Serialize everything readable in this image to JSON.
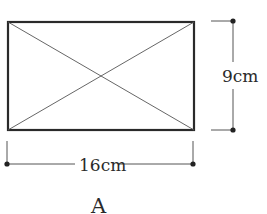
{
  "figure": {
    "label": "A",
    "shape": "rectangle with both diagonals",
    "width_label": "16cm",
    "height_label": "9cm",
    "colors": {
      "stroke": "#2a2a2a",
      "background": "#ffffff"
    }
  }
}
